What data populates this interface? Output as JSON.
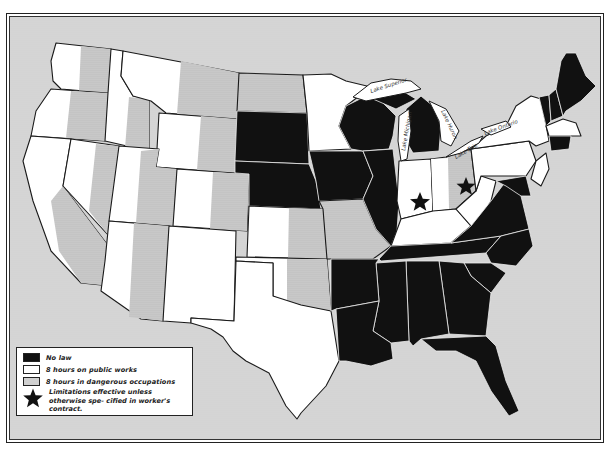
{
  "map": {
    "type": "choropleth",
    "region": "United States",
    "subject": "State hour-limitation laws",
    "colors": {
      "no_law": "#111111",
      "public_works": "#ffffff",
      "dangerous_occupations": "#cfcfcf",
      "background": "#d7d7d7",
      "border": "#222222"
    },
    "lakes": [
      {
        "name": "Lake Superior"
      },
      {
        "name": "Lake Michigan"
      },
      {
        "name": "Lake Huron"
      },
      {
        "name": "Lake Erie"
      },
      {
        "name": "Lake Ontario"
      }
    ],
    "categories": {
      "no_law": [
        "South Dakota",
        "Nebraska",
        "Iowa",
        "Wisconsin",
        "Michigan",
        "Illinois",
        "Arkansas",
        "Louisiana",
        "Mississippi",
        "Alabama",
        "Georgia",
        "Florida",
        "South Carolina",
        "North Carolina",
        "Tennessee",
        "Virginia",
        "Maryland",
        "Maine",
        "Vermont",
        "New Hampshire",
        "Connecticut"
      ],
      "public_works": [
        "Washington",
        "Oregon",
        "California",
        "Nevada",
        "Idaho",
        "Montana",
        "Wyoming",
        "Utah",
        "Arizona",
        "New Mexico",
        "Colorado",
        "Texas",
        "Minnesota",
        "Indiana",
        "Kentucky",
        "West Virginia",
        "New York",
        "Pennsylvania",
        "New Jersey",
        "Massachusetts",
        "Oklahoma",
        "Kansas"
      ],
      "dangerous_occupations": [
        "North Dakota",
        "Missouri",
        "Ohio"
      ],
      "starred": [
        "Indiana",
        "Ohio"
      ]
    }
  },
  "legend": {
    "items": [
      {
        "swatch": "black",
        "label": "No law"
      },
      {
        "swatch": "white",
        "label": "8 hours on public works"
      },
      {
        "swatch": "dotted",
        "label": "8 hours in dangerous occupations"
      }
    ],
    "star": {
      "icon": "star-icon",
      "label": "Limitations effective unless otherwise spe- cified in worker's contract."
    }
  },
  "labels": {
    "lake_superior": "Lake Superior",
    "lake_michigan": "Lake Michigan",
    "lake_huron": "Lake Huron",
    "lake_erie": "Lake Erie",
    "lake_ontario": "Lake Ontario"
  }
}
